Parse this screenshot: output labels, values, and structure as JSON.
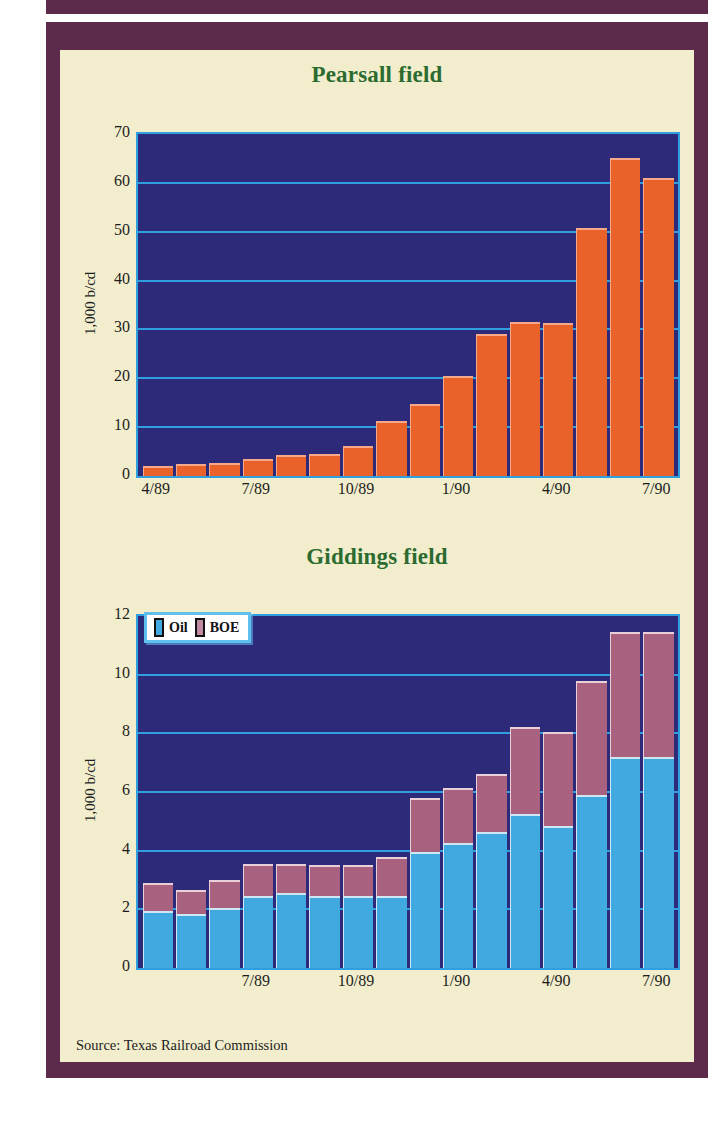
{
  "figure": {
    "source_note": "Source: Texas Railroad Commission",
    "colors": {
      "frame": "#5c2a4a",
      "panel": "#f2eecd",
      "plot_background": "#2d2a7a",
      "gridline": "#2f9fe0",
      "title": "#2c6b2f",
      "oil": "#3fa9e0",
      "boe": "#a8617f",
      "orange": "#e8622a"
    }
  },
  "chart_data": [
    {
      "type": "bar",
      "title": "Pearsall field",
      "ylabel": "1,000 b/cd",
      "xlabel": "",
      "ylim": [
        0,
        70
      ],
      "yticks": [
        0,
        10,
        20,
        30,
        40,
        50,
        60,
        70
      ],
      "grid": true,
      "legend": null,
      "categories": [
        "4/89",
        "5/89",
        "6/89",
        "7/89",
        "8/89",
        "9/89",
        "10/89",
        "11/89",
        "12/89",
        "1/90",
        "2/90",
        "3/90",
        "4/90",
        "5/90",
        "6/90",
        "7/90"
      ],
      "xtick_labels": [
        "4/89",
        "7/89",
        "10/89",
        "1/90",
        "4/90",
        "7/90"
      ],
      "xtick_indices": [
        0,
        3,
        6,
        9,
        12,
        15
      ],
      "series": [
        {
          "name": "Production",
          "values": [
            2.0,
            2.4,
            2.6,
            3.5,
            4.4,
            4.6,
            6.2,
            11.2,
            14.7,
            20.4,
            29.0,
            31.6,
            31.3,
            50.8,
            65.0,
            61.0
          ]
        }
      ]
    },
    {
      "type": "bar",
      "stacked": true,
      "title": "Giddings field",
      "ylabel": "1,000 b/cd",
      "xlabel": "",
      "ylim": [
        0,
        12
      ],
      "yticks": [
        0,
        2,
        4,
        6,
        8,
        10,
        12
      ],
      "grid": true,
      "legend": {
        "position": "top-left",
        "entries": [
          "Oil",
          "BOE"
        ]
      },
      "categories": [
        "4/89",
        "5/89",
        "6/89",
        "7/89",
        "8/89",
        "9/89",
        "10/89",
        "11/89",
        "12/89",
        "1/90",
        "2/90",
        "3/90",
        "4/90",
        "5/90",
        "6/90",
        "7/90"
      ],
      "xtick_labels": [
        "7/89",
        "10/89",
        "1/90",
        "4/90",
        "7/90"
      ],
      "xtick_indices": [
        3,
        6,
        9,
        12,
        15
      ],
      "series": [
        {
          "name": "Oil",
          "values": [
            1.95,
            1.85,
            2.05,
            2.45,
            2.55,
            2.45,
            2.45,
            2.45,
            3.95,
            4.25,
            4.65,
            5.25,
            4.85,
            5.9,
            7.2,
            7.2
          ]
        },
        {
          "name": "BOE",
          "values": [
            0.95,
            0.8,
            0.95,
            1.1,
            1.0,
            1.05,
            1.05,
            1.35,
            1.85,
            1.9,
            1.95,
            2.95,
            3.2,
            3.9,
            4.25,
            4.25
          ]
        }
      ],
      "totals": [
        2.9,
        2.65,
        3.0,
        3.55,
        3.55,
        3.5,
        3.5,
        3.8,
        5.8,
        6.15,
        6.6,
        8.2,
        8.05,
        9.8,
        11.45,
        11.45
      ]
    }
  ]
}
